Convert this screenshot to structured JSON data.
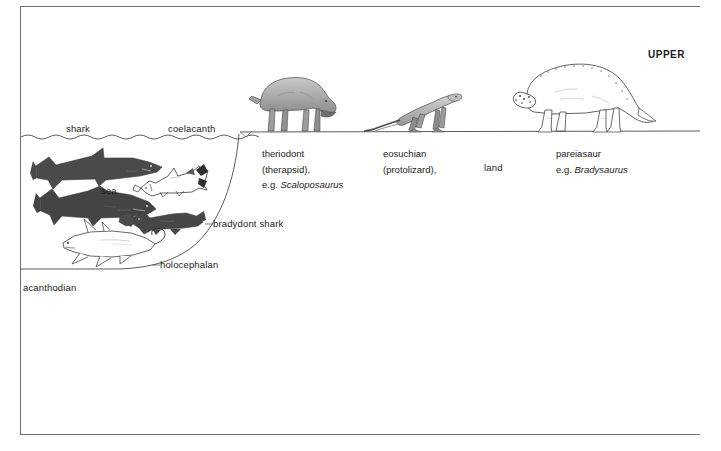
{
  "figure": {
    "title_text": "UPPER",
    "period_note": "UPPER"
  },
  "colors": {
    "frame": "#6f6f6f",
    "ink": "#1b1b1b",
    "shark_fill": "#4a4a4a",
    "shark_fill_dark": "#3f3f3f",
    "reptile_fill": "#a9a9a9",
    "reptile_fill_light": "#bdbdbd",
    "outline": "#2b2b2b",
    "waterline": "#4a4a4a",
    "landline": "#4a4a4a",
    "background": "#ffffff"
  },
  "labels": {
    "shark": "shark",
    "coelacanth": "coelacanth",
    "sea": "sea",
    "bradydont_shark": "bradydont shark",
    "holocephalan": "holocephalan",
    "acanthodian": "acanthodian",
    "land": "land",
    "upper": "UPPER"
  },
  "captions": [
    {
      "name": "theriodont",
      "lines": [
        "theriodont",
        "(therapsid),"
      ],
      "example_prefix": "e.g. ",
      "example_genus": "Scaloposaurus"
    },
    {
      "name": "eosuchian",
      "lines": [
        "eosuchian",
        "(protolizard),"
      ],
      "example_prefix": "",
      "example_genus": ""
    },
    {
      "name": "pareiasaur",
      "lines": [
        "pareiasaur"
      ],
      "example_prefix": "e.g. ",
      "example_genus": "Bradysaurus"
    }
  ],
  "creatures": {
    "marine": [
      {
        "id": "shark-upper",
        "label_ref": "shark",
        "style": "silhouette-dark"
      },
      {
        "id": "shark-lower",
        "label_ref": "shark",
        "style": "silhouette-dark"
      },
      {
        "id": "coelacanth",
        "label_ref": "coelacanth",
        "style": "outline-white"
      },
      {
        "id": "bradydont-shark",
        "label_ref": "bradydont_shark",
        "style": "silhouette-dark"
      },
      {
        "id": "holocephalan",
        "label_ref": "holocephalan",
        "style": "silhouette-dark"
      },
      {
        "id": "acanthodian",
        "label_ref": "acanthodian",
        "style": "outline-white"
      }
    ],
    "terrestrial": [
      {
        "id": "theriodont",
        "label_ref": "theriodont",
        "style": "shaded-gray"
      },
      {
        "id": "eosuchian",
        "label_ref": "eosuchian",
        "style": "shaded-gray"
      },
      {
        "id": "pareiasaur",
        "label_ref": "pareiasaur",
        "style": "outline-white"
      }
    ]
  }
}
